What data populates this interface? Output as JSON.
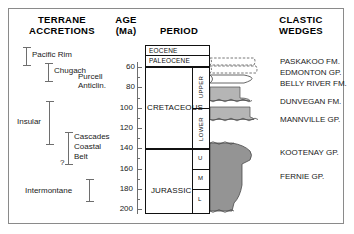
{
  "headers": {
    "terrane": "TERRANE\nACCRETIONS",
    "terrane_line1": "TERRANE",
    "terrane_line2": "ACCRETIONS",
    "age_line1": "AGE",
    "age_line2": "(Ma)",
    "period": "PERIOD",
    "clastic_line1": "CLASTIC",
    "clastic_line2": "WEDGES"
  },
  "terranes": [
    {
      "label": "Pacific Rim",
      "start_ma": 50,
      "end_ma": 68,
      "label_side": "right"
    },
    {
      "label": "Chugach",
      "start_ma": 64,
      "end_ma": 82,
      "label_side": "right"
    },
    {
      "label": "Purcell Anticlin.",
      "line1": "Purcell",
      "line2": "Anticlin.",
      "start_ma": null,
      "end_ma": null,
      "label_side": "text-only"
    },
    {
      "label": "Insular",
      "start_ma": 102,
      "end_ma": 144,
      "label_side": "left"
    },
    {
      "label": "Cascades Coastal Belt",
      "line1": "Cascades",
      "line2": "Coastal",
      "line3": "Belt",
      "start_ma": 132,
      "end_ma": 165,
      "label_side": "right",
      "query": "?"
    },
    {
      "label": "Intermontane",
      "start_ma": 180,
      "end_ma": 202,
      "label_side": "left"
    }
  ],
  "axis": {
    "unit": "Ma",
    "min": 55,
    "max": 205,
    "labeled_ticks": [
      60,
      80,
      100,
      120,
      140,
      160,
      180,
      200
    ],
    "minor_tick_interval": 10
  },
  "periods": [
    {
      "name": "EOCENE",
      "rank": "epoch",
      "top_ma": 55,
      "base_ma": 58.5
    },
    {
      "name": "PALEOCENE",
      "rank": "epoch",
      "top_ma": 58.5,
      "base_ma": 65
    },
    {
      "name": "CRETACEOUS",
      "rank": "period",
      "top_ma": 65,
      "base_ma": 144
    },
    {
      "name": "JURASSIC",
      "rank": "period",
      "top_ma": 144,
      "base_ma": 205
    }
  ],
  "epochs": [
    {
      "name": "UPPER",
      "parent": "CRETACEOUS",
      "top_ma": 65,
      "base_ma": 100
    },
    {
      "name": "LOWER",
      "parent": "CRETACEOUS",
      "top_ma": 100,
      "base_ma": 144
    },
    {
      "name": "U",
      "parent": "JURASSIC",
      "top_ma": 144,
      "base_ma": 163
    },
    {
      "name": "M",
      "parent": "JURASSIC",
      "top_ma": 163,
      "base_ma": 183
    },
    {
      "name": "L",
      "parent": "JURASSIC",
      "top_ma": 183,
      "base_ma": 205
    }
  ],
  "clastic_wedges": [
    {
      "label": "PASKAKOO FM.",
      "top_ma": 58,
      "base_ma": 62,
      "fill": "#ffffff"
    },
    {
      "label": "EDMONTON GP.",
      "top_ma": 66,
      "base_ma": 70,
      "fill": "#ffffff"
    },
    {
      "label": "BELLY RIVER FM.",
      "top_ma": 74,
      "base_ma": 80,
      "fill": "#ffffff"
    },
    {
      "label": "DUNVEGAN FM.",
      "top_ma": 92,
      "base_ma": 100,
      "fill": "#b5b5b5"
    },
    {
      "label": "MANNVILLE GP.",
      "top_ma": 107,
      "base_ma": 118,
      "fill": "#b5b5b5"
    },
    {
      "label": "KOOTENAY GP.",
      "top_ma": 142,
      "base_ma": 170,
      "fill": "#949494"
    },
    {
      "label": "FERNIE GP.",
      "top_ma": 170,
      "base_ma": 205,
      "fill": "#949494"
    }
  ],
  "colors": {
    "frame": "#8a8a8a",
    "box_line": "#111111",
    "bar": "#6e6e6e",
    "wedge_light": "#b5b5b5",
    "wedge_dark": "#949494",
    "text": "#1a1a1a",
    "background": "#ffffff"
  }
}
